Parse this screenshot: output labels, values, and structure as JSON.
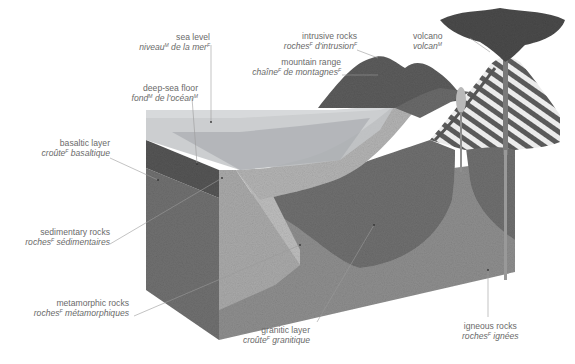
{
  "diagram": {
    "colors": {
      "background": "#ffffff",
      "label_text": "#6a6a6a",
      "leader_line": "#9a9a9a",
      "water": "#b9bcbe",
      "water_top": "#cfd1d2",
      "basaltic": "#6e6e6e",
      "sedimentary": "#a6a6a6",
      "metamorphic": "#b4b4b4",
      "granitic": "#6f6f6f",
      "igneous": "#8c8c8c",
      "block_side": "#7a7a7a",
      "mountain": "#5e5e5e",
      "volcano_stripes": "#e8e8e8",
      "smoke": "#4a4a4a"
    },
    "labels": [
      {
        "id": "sea-level",
        "en": "sea level",
        "fr": "niveau",
        "fr_gender": "M",
        "fr_rest": " de la mer",
        "fr_rest_gender": "F"
      },
      {
        "id": "deep-sea-floor",
        "en": "deep-sea floor",
        "fr": "fond",
        "fr_gender": "M",
        "fr_rest": " de l'océan",
        "fr_rest_gender": "M"
      },
      {
        "id": "intrusive-rocks",
        "en": "intrusive rocks",
        "fr": "roches",
        "fr_gender": "F",
        "fr_rest": " d'intrusion",
        "fr_rest_gender": "F"
      },
      {
        "id": "mountain-range",
        "en": "mountain range",
        "fr": "chaîne",
        "fr_gender": "F",
        "fr_rest": " de montagnes",
        "fr_rest_gender": "F"
      },
      {
        "id": "volcano",
        "en": "volcano",
        "fr": "volcan",
        "fr_gender": "M",
        "fr_rest": "",
        "fr_rest_gender": ""
      },
      {
        "id": "basaltic-layer",
        "en": "basaltic layer",
        "fr": "croûte",
        "fr_gender": "F",
        "fr_rest": " basaltique",
        "fr_rest_gender": ""
      },
      {
        "id": "sedimentary-rocks",
        "en": "sedimentary rocks",
        "fr": "roches",
        "fr_gender": "F",
        "fr_rest": " sédimentaires",
        "fr_rest_gender": ""
      },
      {
        "id": "metamorphic-rocks",
        "en": "metamorphic rocks",
        "fr": "roches",
        "fr_gender": "F",
        "fr_rest": " métamorphiques",
        "fr_rest_gender": ""
      },
      {
        "id": "granitic-layer",
        "en": "granitic layer",
        "fr": "croûte",
        "fr_gender": "F",
        "fr_rest": " granitique",
        "fr_rest_gender": ""
      },
      {
        "id": "igneous-rocks",
        "en": "igneous rocks",
        "fr": "roches",
        "fr_gender": "F",
        "fr_rest": " ignées",
        "fr_rest_gender": ""
      }
    ]
  }
}
